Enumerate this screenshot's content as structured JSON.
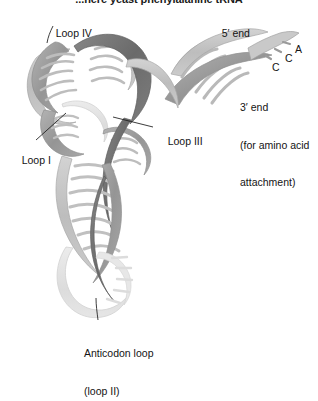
{
  "figure": {
    "title": "...here yeast phenylalanine tRNA",
    "background_color": "#ffffff",
    "ribbon_colors": {
      "dark_strand": "#6f6f6f",
      "mid_strand": "#9a9a9a",
      "light_strand": "#c4c4c4",
      "pale_strand": "#e2e2e2",
      "outline": "#8a8a8a",
      "leader_line": "#1a1a1a",
      "text": "#141414"
    },
    "labels": {
      "loop_iv": "Loop IV",
      "five_prime_end": "5′ end",
      "loop_iii": "Loop III",
      "loop_i": "Loop I",
      "three_prime_end_line1": "3′ end",
      "three_prime_end_line2": "(for amino acid",
      "three_prime_end_line3": "attachment)",
      "anticodon_line1": "Anticodon loop",
      "anticodon_line2": "(loop II)"
    },
    "nucleotides": {
      "a": "A",
      "c1": "C",
      "c2": "C"
    }
  }
}
